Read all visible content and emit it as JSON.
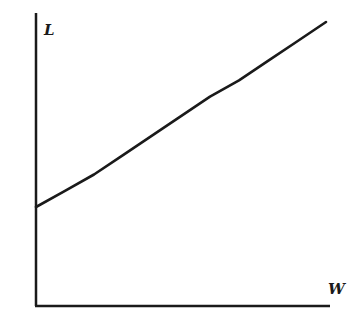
{
  "chart_data": {
    "type": "line",
    "title": "",
    "xlabel": "W",
    "ylabel": "L",
    "grid": false,
    "legend": null,
    "ticks": {
      "x": [],
      "y": []
    },
    "xlim": [
      0,
      1
    ],
    "ylim": [
      0,
      1
    ],
    "series": [
      {
        "name": "L vs W",
        "x": [
          0.0,
          0.1,
          0.2,
          0.3,
          0.4,
          0.5,
          0.6,
          0.7,
          0.8,
          0.9,
          1.0
        ],
        "y": [
          0.34,
          0.39,
          0.44,
          0.5,
          0.56,
          0.62,
          0.68,
          0.73,
          0.79,
          0.85,
          0.91
        ]
      }
    ]
  },
  "axes": {
    "x_label": "W",
    "y_label": "L"
  },
  "colors": {
    "line": "#1a1a1a",
    "axis": "#1a1a1a",
    "background": "#ffffff"
  }
}
